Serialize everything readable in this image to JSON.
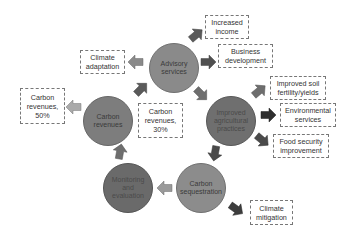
{
  "diagram": {
    "nodes": [
      {
        "id": "advisory",
        "label": "Advisory services",
        "color": "#8a8a8a",
        "cx": 174,
        "cy": 68,
        "r": 25
      },
      {
        "id": "practices",
        "label": "Improved agricultural practices",
        "color": "#6f6f6f",
        "cx": 231,
        "cy": 121,
        "r": 25
      },
      {
        "id": "sequestration",
        "label": "Carbon sequestration",
        "color": "#8c8c8c",
        "cx": 201,
        "cy": 188,
        "r": 25
      },
      {
        "id": "monitoring",
        "label": "Monitoring and evaluation",
        "color": "#6a6a6a",
        "cx": 128,
        "cy": 188,
        "r": 25
      },
      {
        "id": "revenues",
        "label": "Carbon revenues",
        "color": "#7d7d7d",
        "cx": 108,
        "cy": 121,
        "r": 25
      }
    ],
    "boxes": [
      {
        "id": "increased-income",
        "label": "Increased income"
      },
      {
        "id": "business-development",
        "label": "Business development"
      },
      {
        "id": "soil-fertility",
        "label": "Improved soil fertility/yields"
      },
      {
        "id": "environmental-services",
        "label": "Environmental services"
      },
      {
        "id": "food-security",
        "label": "Food security improvement"
      },
      {
        "id": "climate-mitigation",
        "label": "Climate mitigation"
      },
      {
        "id": "climate-adaptation",
        "label": "Climate adaptation"
      },
      {
        "id": "carbon-revenues-50",
        "label": "Carbon revenues, 50%"
      },
      {
        "id": "carbon-revenues-30",
        "label": "Carbon revenues, 30%"
      }
    ],
    "colors": {
      "arrow_dark": "#4a4a4a",
      "arrow_mid": "#6e6e6e",
      "arrow_light": "#9a9a9a",
      "box_border": "#777777"
    }
  }
}
